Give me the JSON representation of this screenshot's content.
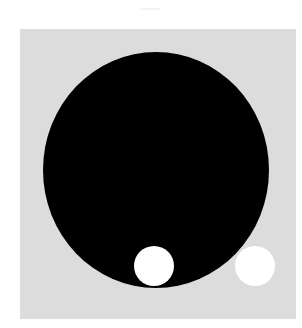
{
  "figure": {
    "background_color": "#ffffff",
    "panel": {
      "color": "#dcdcdc",
      "x": 20,
      "y": 29,
      "width": 276,
      "height": 290
    },
    "shapes": [
      {
        "name": "large-black-disc",
        "color": "#000000",
        "cx": 156,
        "cy": 170,
        "rx": 113,
        "ry": 118
      },
      {
        "name": "white-circle-inside",
        "color": "#ffffff",
        "cx": 154,
        "cy": 266,
        "r": 20
      },
      {
        "name": "white-circle-outside",
        "color": "#ffffff",
        "cx": 255,
        "cy": 266,
        "r": 20
      }
    ]
  }
}
